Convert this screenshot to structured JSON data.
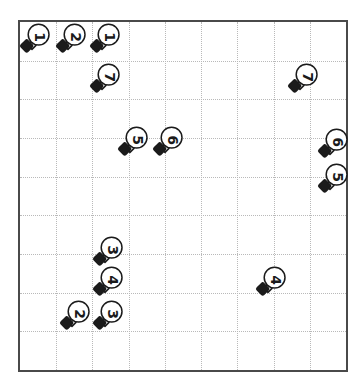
{
  "figure": {
    "title": "",
    "background_color": "#ffffff",
    "frame_color": "#4a4a4a",
    "grid_color": "#b9b9b9",
    "marker_color": "#1b1b1b",
    "marker_fill": "#ffffff"
  },
  "chart_data": {
    "type": "scatter",
    "title": "",
    "xlabel": "",
    "ylabel": "",
    "xlim": [
      0,
      9
    ],
    "ylim": [
      0,
      9
    ],
    "grid": true,
    "grid_style": "dotted",
    "grid_columns": 9,
    "grid_rows": 9,
    "legend": "none",
    "marker_shape": "light-bulb",
    "point_label_rotation_deg": 90,
    "points": [
      {
        "label": "1",
        "px": 22,
        "py": 45,
        "gx": 0.11,
        "gy": 8.36
      },
      {
        "label": "2",
        "px": 58,
        "py": 45,
        "gx": 1.09,
        "gy": 8.36
      },
      {
        "label": "1",
        "px": 92,
        "py": 45,
        "gx": 2.02,
        "gy": 8.36
      },
      {
        "label": "7",
        "px": 92,
        "py": 85,
        "gx": 2.02,
        "gy": 7.34
      },
      {
        "label": "7",
        "px": 290,
        "py": 85,
        "gx": 7.42,
        "gy": 7.34
      },
      {
        "label": "5",
        "px": 120,
        "py": 148,
        "gx": 2.78,
        "gy": 5.72
      },
      {
        "label": "6",
        "px": 155,
        "py": 148,
        "gx": 3.74,
        "gy": 5.72
      },
      {
        "label": "6",
        "px": 320,
        "py": 150,
        "gx": 8.24,
        "gy": 5.67
      },
      {
        "label": "5",
        "px": 320,
        "py": 185,
        "gx": 8.24,
        "gy": 4.77
      },
      {
        "label": "3",
        "px": 95,
        "py": 258,
        "gx": 2.1,
        "gy": 2.9
      },
      {
        "label": "4",
        "px": 95,
        "py": 288,
        "gx": 2.1,
        "gy": 2.13
      },
      {
        "label": "4",
        "px": 258,
        "py": 288,
        "gx": 6.54,
        "gy": 2.13
      },
      {
        "label": "2",
        "px": 62,
        "py": 322,
        "gx": 1.2,
        "gy": 1.26
      },
      {
        "label": "3",
        "px": 95,
        "py": 322,
        "gx": 2.1,
        "gy": 1.26
      }
    ]
  }
}
